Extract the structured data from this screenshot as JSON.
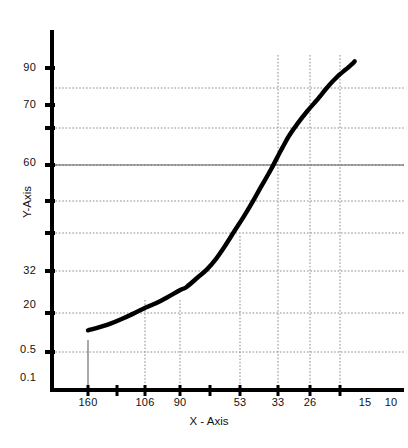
{
  "chart_data": {
    "type": "line",
    "title": "",
    "xlabel": "X - Axis",
    "ylabel": "Y-Axis",
    "grid": true,
    "legend": "none",
    "background": "#ffffff",
    "line_color": "#000000",
    "line_width": 4,
    "grid_color": "#808080",
    "axis_color": "#000000",
    "x_tick_labels": [
      "160",
      "106",
      "90",
      "53",
      "33",
      "26",
      "15",
      "10"
    ],
    "y_tick_labels": [
      "90",
      "70",
      "60",
      "32",
      "20",
      "0.5",
      "0.1"
    ],
    "x_axis_direction": "decreasing",
    "xlim": [
      160,
      10
    ],
    "ylim": [
      0.1,
      100
    ],
    "x": [
      160,
      150,
      140,
      130,
      120,
      110,
      106,
      100,
      95,
      90,
      85,
      80,
      75,
      70,
      65,
      60,
      55,
      53,
      50,
      45,
      40,
      35,
      33,
      30,
      28,
      26,
      24,
      22,
      20,
      18,
      16,
      15,
      14
    ],
    "y": [
      0.25,
      0.28,
      0.33,
      0.4,
      0.48,
      0.6,
      0.65,
      0.8,
      0.95,
      1.2,
      1.6,
      2.2,
      3.0,
      4.2,
      6.0,
      8.5,
      12.5,
      14.5,
      18.0,
      24.0,
      31.0,
      39.0,
      43.0,
      50.0,
      55.0,
      60.0,
      65.0,
      70.0,
      75.0,
      80.0,
      86.0,
      89.0,
      93.0
    ],
    "series_name": "curve"
  },
  "axes": {
    "y_ticks": [
      {
        "label": "90",
        "pixel_y": 68
      },
      {
        "label": "70",
        "pixel_y": 105
      },
      {
        "label": "60",
        "pixel_y": 163
      },
      {
        "label": "32",
        "pixel_y": 271
      },
      {
        "label": "20",
        "pixel_y": 305
      },
      {
        "label": "0.5",
        "pixel_y": 350
      },
      {
        "label": "0.1",
        "pixel_y": 378
      }
    ],
    "x_ticks": [
      {
        "label": "160",
        "pixel_x": 88
      },
      {
        "label": "106",
        "pixel_x": 145
      },
      {
        "label": "90",
        "pixel_x": 180
      },
      {
        "label": "53",
        "pixel_x": 240
      },
      {
        "label": "33",
        "pixel_x": 278
      },
      {
        "label": "26",
        "pixel_x": 310
      },
      {
        "label": "15",
        "pixel_x": 365
      },
      {
        "label": "10",
        "pixel_x": 391
      }
    ]
  }
}
